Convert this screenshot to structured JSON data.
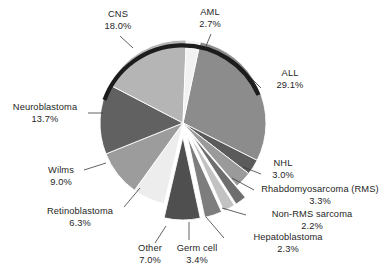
{
  "chart_data": {
    "type": "pie",
    "title": "",
    "subtitle": "",
    "xlabel": "",
    "ylabel": "",
    "legend_position": "none",
    "grid": false,
    "units": "percent",
    "total": 100.0,
    "categories": [
      "ALL",
      "NHL",
      "Rhabdomyosarcoma (RMS)",
      "Non-RMS sarcoma",
      "Hepatoblastoma",
      "Germ cell",
      "Other",
      "Retinoblastoma",
      "Wilms",
      "Neuroblastoma",
      "CNS",
      "AML"
    ],
    "values": [
      29.1,
      3.0,
      3.3,
      2.2,
      2.3,
      3.4,
      7.0,
      6.3,
      9.0,
      13.7,
      18.0,
      2.7
    ],
    "slices": [
      {
        "label": "ALL",
        "value": 29.1,
        "value_text": "29.1%",
        "color": "#8c8c8c",
        "exploded": false
      },
      {
        "label": "NHL",
        "value": 3.0,
        "value_text": "3.0%",
        "color": "#5b5b5b",
        "exploded": false
      },
      {
        "label": "Rhabdomyosarcoma (RMS)",
        "value": 3.3,
        "value_text": "3.3%",
        "color": "#9a9a9a",
        "exploded": false
      },
      {
        "label": "Non-RMS sarcoma",
        "value": 2.2,
        "value_text": "2.2%",
        "color": "#6e6e6e",
        "exploded": true
      },
      {
        "label": "Hepatoblastoma",
        "value": 2.3,
        "value_text": "2.3%",
        "color": "#c2c2c2",
        "exploded": true
      },
      {
        "label": "Germ cell",
        "value": 3.4,
        "value_text": "3.4%",
        "color": "#7d7d7d",
        "exploded": true
      },
      {
        "label": "Other",
        "value": 7.0,
        "value_text": "7.0%",
        "color": "#4f4f4f",
        "exploded": true
      },
      {
        "label": "Retinoblastoma",
        "value": 6.3,
        "value_text": "6.3%",
        "color": "#ededed",
        "exploded": false
      },
      {
        "label": "Wilms",
        "value": 9.0,
        "value_text": "9.0%",
        "color": "#9c9c9c",
        "exploded": false
      },
      {
        "label": "Neuroblastoma",
        "value": 13.7,
        "value_text": "13.7%",
        "color": "#616161",
        "exploded": false
      },
      {
        "label": "CNS",
        "value": 18.0,
        "value_text": "18.0%",
        "color": "#b5b5b5",
        "exploded": false
      },
      {
        "label": "AML",
        "value": 2.7,
        "value_text": "2.7%",
        "color": "#f2f2f2",
        "exploded": false
      }
    ]
  },
  "labels": {
    "cns": {
      "name": "CNS",
      "value": "18.0%"
    },
    "aml": {
      "name": "AML",
      "value": "2.7%"
    },
    "all": {
      "name": "ALL",
      "value": "29.1%"
    },
    "nhl": {
      "name": "NHL",
      "value": "3.0%"
    },
    "rms": {
      "name": "Rhabdomyosarcoma (RMS)",
      "value": "3.3%"
    },
    "nonrms": {
      "name": "Non-RMS sarcoma",
      "value": "2.2%"
    },
    "hepatoblastoma": {
      "name": "Hepatoblastoma",
      "value": "2.3%"
    },
    "germcell": {
      "name": "Germ cell",
      "value": "3.4%"
    },
    "other": {
      "name": "Other",
      "value": "7.0%"
    },
    "retinoblastoma": {
      "name": "Retinoblastoma",
      "value": "6.3%"
    },
    "wilms": {
      "name": "Wilms",
      "value": "9.0%"
    },
    "neuroblastoma": {
      "name": "Neuroblastoma",
      "value": "13.7%"
    }
  },
  "colors": {
    "background": "#ffffff",
    "text": "#262626",
    "rim": "#1c1c1c",
    "separator": "#ffffff"
  }
}
